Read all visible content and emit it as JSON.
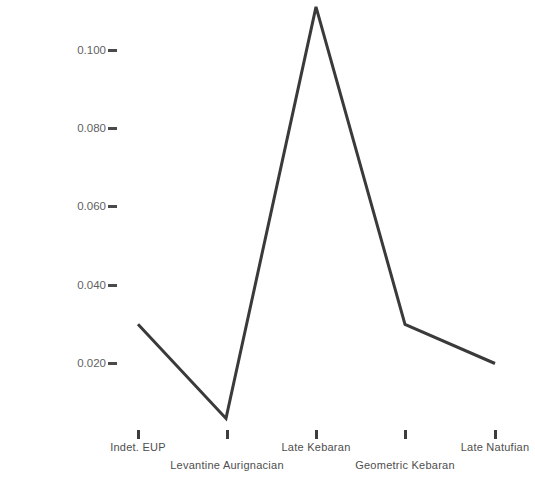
{
  "chart_data": {
    "type": "line",
    "title": "",
    "xlabel": "",
    "ylabel": "neo-cresting degree at bladelet production",
    "categories": [
      "Indet. EUP",
      "Levantine Aurignacian",
      "Late Kebaran",
      "Geometric Kebaran",
      "Late Natufian"
    ],
    "values": [
      0.03,
      0.006,
      0.111,
      0.03,
      0.02
    ],
    "series": [
      {
        "name": "neo-cresting degree at bladelet production",
        "values": [
          0.03,
          0.006,
          0.111,
          0.03,
          0.02
        ]
      }
    ],
    "ytick_labels": [
      "0.100",
      "0.080",
      "0.060",
      "0.040",
      "0.020"
    ],
    "ytick_values": [
      0.1,
      0.08,
      0.06,
      0.04,
      0.02
    ],
    "ylim": [
      0.0,
      0.115
    ],
    "grid": false,
    "legend": false,
    "legend_position": "none",
    "line_color": "#3a3a3a",
    "background_color": "#ffffff",
    "axis_text_color": "#4e4e4e"
  },
  "axes": {
    "y_title": "neo-cresting degree at bladelet production",
    "y_ticks": [
      {
        "label": "0.100",
        "value": 0.1
      },
      {
        "label": "0.080",
        "value": 0.08
      },
      {
        "label": "0.060",
        "value": 0.06
      },
      {
        "label": "0.040",
        "value": 0.04
      },
      {
        "label": "0.020",
        "value": 0.02
      }
    ],
    "x_ticks": [
      {
        "label": "Indet. EUP",
        "row": 1
      },
      {
        "label": "Levantine Aurignacian",
        "row": 2
      },
      {
        "label": "Late Kebaran",
        "row": 1
      },
      {
        "label": "Geometric Kebaran",
        "row": 2
      },
      {
        "label": "Late Natufian",
        "row": 1
      }
    ]
  }
}
